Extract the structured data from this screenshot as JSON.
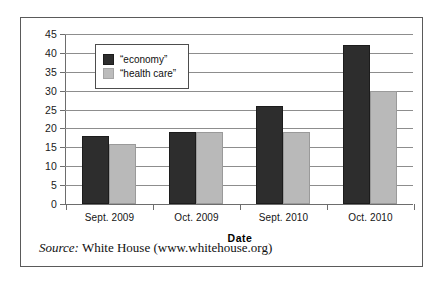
{
  "chart_data": {
    "type": "bar",
    "title": "",
    "xlabel": "Date",
    "ylabel": "",
    "ylim": [
      0,
      45
    ],
    "yticks": [
      45,
      40,
      35,
      30,
      25,
      20,
      15,
      10,
      5,
      0
    ],
    "grid": true,
    "legend_position": "top-left-inside",
    "categories": [
      "Sept. 2009",
      "Oct. 2009",
      "Sept. 2010",
      "Oct. 2010"
    ],
    "series": [
      {
        "name": "“economy”",
        "color": "#2d2d2d",
        "values": [
          18,
          19,
          26,
          42
        ]
      },
      {
        "name": "“health care”",
        "color": "#b9b9b9",
        "values": [
          16,
          19,
          19,
          30
        ]
      }
    ]
  },
  "legend": {
    "items": [
      {
        "label": "“economy”"
      },
      {
        "label": "“health care”"
      }
    ]
  },
  "caption": {
    "source_label": "Source:",
    "source_text": "White House (www.whitehouse.org)"
  }
}
